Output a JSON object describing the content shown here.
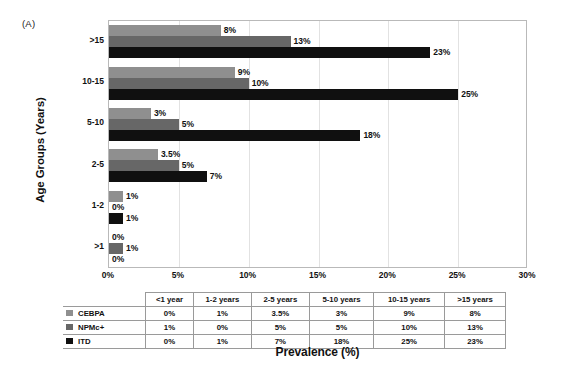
{
  "panel_label": "(A)",
  "chart_data": {
    "type": "bar",
    "orientation": "horizontal",
    "title": "",
    "xlabel": "Prevalence (%)",
    "ylabel": "Age Groups (Years)",
    "xlim": [
      0,
      30
    ],
    "xticks": [
      "0%",
      "5%",
      "10%",
      "15%",
      "20%",
      "25%",
      "30%"
    ],
    "xtick_values": [
      0,
      5,
      10,
      15,
      20,
      25,
      30
    ],
    "grid": true,
    "legend_position": "table",
    "categories": [
      ">1",
      "1-2",
      "2-5",
      "5-10",
      "10-15",
      ">15"
    ],
    "category_labels_display": [
      ">15",
      "10-15",
      "5-10",
      "2-5",
      "1-2",
      ">1"
    ],
    "series": [
      {
        "name": "CEBPA",
        "color": "#8f8f8f",
        "values": [
          0,
          1,
          3.5,
          3,
          9,
          8
        ],
        "labels": [
          "0%",
          "1%",
          "3.5%",
          "3%",
          "9%",
          "8%"
        ]
      },
      {
        "name": "NPMc+",
        "color": "#676767",
        "values": [
          1,
          0,
          5,
          5,
          10,
          13
        ],
        "labels": [
          "1%",
          "0%",
          "5%",
          "5%",
          "10%",
          "13%"
        ]
      },
      {
        "name": "ITD",
        "color": "#101010",
        "values": [
          0,
          1,
          7,
          18,
          25,
          23
        ],
        "labels": [
          "0%",
          "1%",
          "7%",
          "18%",
          "25%",
          "23%"
        ]
      }
    ]
  },
  "table": {
    "corner_label": "",
    "columns": [
      "<1 year",
      "1-2 years",
      "2-5 years",
      "5-10 years",
      "10-15 years",
      ">15 years"
    ],
    "rows": [
      {
        "label": "CEBPA",
        "color": "#8f8f8f",
        "values": [
          "0%",
          "1%",
          "3.5%",
          "3%",
          "9%",
          "8%"
        ]
      },
      {
        "label": "NPMc+",
        "color": "#676767",
        "values": [
          "1%",
          "0%",
          "5%",
          "5%",
          "10%",
          "13%"
        ]
      },
      {
        "label": "ITD",
        "color": "#101010",
        "values": [
          "0%",
          "1%",
          "7%",
          "18%",
          "25%",
          "23%"
        ]
      }
    ]
  }
}
